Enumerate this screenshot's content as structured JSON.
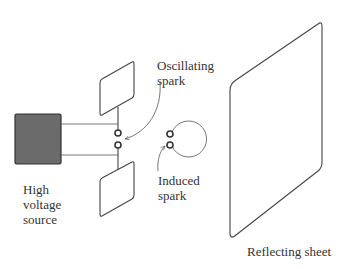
{
  "diagram": {
    "colors": {
      "line": "#444444",
      "source_fill": "#6b6b6b",
      "text": "#333333",
      "background": "#ffffff"
    },
    "labels": {
      "oscillating_spark_line1": "Oscillating",
      "oscillating_spark_line2": "spark",
      "induced_spark_line1": "Induced",
      "induced_spark_line2": "spark",
      "source_line1": "High",
      "source_line2": "voltage",
      "source_line3": "source",
      "reflector": "Reflecting sheet"
    },
    "components": [
      {
        "id": "high-voltage-source",
        "label": "High voltage source"
      },
      {
        "id": "upper-plate",
        "label": ""
      },
      {
        "id": "lower-plate",
        "label": ""
      },
      {
        "id": "oscillating-spark-gap",
        "label": "Oscillating spark"
      },
      {
        "id": "induced-loop",
        "label": "Induced spark"
      },
      {
        "id": "reflecting-sheet",
        "label": "Reflecting sheet"
      }
    ]
  }
}
